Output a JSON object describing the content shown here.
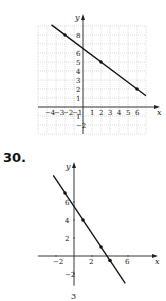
{
  "problem": {
    "number_label": "30.",
    "bottom_fragment": "3"
  },
  "chart_data": [
    {
      "type": "line",
      "title": "",
      "xlabel": "x",
      "ylabel": "y",
      "grid": true,
      "xlim": [
        -4,
        7
      ],
      "ylim": [
        -3,
        9
      ],
      "x_ticks": [
        -4,
        -3,
        -2,
        -1,
        1,
        2,
        3,
        4,
        5,
        6
      ],
      "x_tick_labels": [
        "−4",
        "−3",
        "−2",
        "−1",
        "1",
        "2",
        "3",
        "4",
        "5",
        "6"
      ],
      "y_ticks": [
        -2,
        -1,
        1,
        2,
        3,
        4,
        5,
        6,
        8
      ],
      "y_tick_labels": [
        "−2",
        "1",
        "1",
        "2",
        "3",
        "4",
        "5",
        "6",
        "8"
      ],
      "points": [
        {
          "x": -2,
          "y": 8
        },
        {
          "x": 2,
          "y": 5
        },
        {
          "x": 6,
          "y": 2
        }
      ],
      "line": {
        "slope": -0.75,
        "intercept": 6.5,
        "x_from": -3.5,
        "x_to": 7
      }
    },
    {
      "type": "line",
      "title": "",
      "xlabel": "x",
      "ylabel": "y",
      "grid": false,
      "xlim": [
        -3,
        7
      ],
      "ylim": [
        -3,
        10
      ],
      "x_ticks": [
        -2,
        2,
        6
      ],
      "x_tick_labels": [
        "−2",
        "2",
        "6"
      ],
      "y_ticks": [
        -2,
        2,
        4,
        6
      ],
      "y_tick_labels": [
        "−2",
        "2",
        "4",
        "6"
      ],
      "points": [
        {
          "x": -1,
          "y": 7
        },
        {
          "x": 1,
          "y": 4
        },
        {
          "x": 3,
          "y": 1
        },
        {
          "x": 4,
          "y": -0.5
        }
      ],
      "line": {
        "slope": -1.5,
        "intercept": 5.5,
        "x_from": -2.3,
        "x_to": 5.7
      }
    }
  ]
}
